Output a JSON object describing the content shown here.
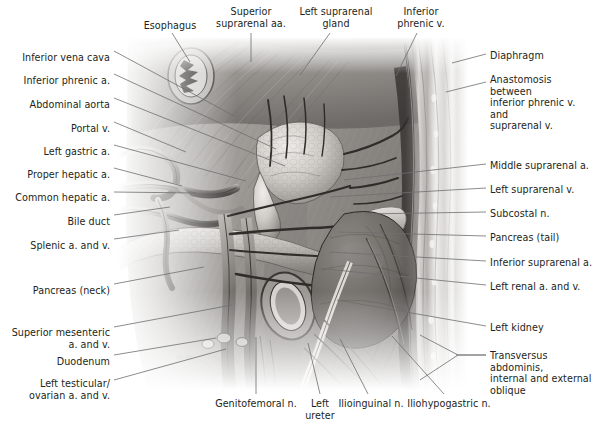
{
  "figure": {
    "type": "anatomical-illustration",
    "style": "grayscale halftone medical illustration",
    "artist_signature": "W.W.",
    "colors": {
      "background": "#ffffff",
      "leader_line": "#6e6e6e",
      "label_text": "#231f20",
      "plate_light": "#e9e7e4",
      "plate_mid": "#9a9692",
      "plate_dark": "#4a4744",
      "plate_darkest": "#262423"
    }
  },
  "labels": {
    "left": [
      {
        "id": "inferior-vena-cava",
        "text": "Inferior vena cava",
        "x": 110,
        "y": 52,
        "lead": [
          [
            114,
            51
          ],
          [
            236,
            117
          ]
        ]
      },
      {
        "id": "inferior-phrenic-a",
        "text": "Inferior phrenic a.",
        "x": 110,
        "y": 75,
        "lead": [
          [
            114,
            74
          ],
          [
            276,
            149
          ]
        ]
      },
      {
        "id": "abdominal-aorta",
        "text": "Abdominal aorta",
        "x": 110,
        "y": 99,
        "lead": [
          [
            114,
            98
          ],
          [
            285,
            166
          ]
        ]
      },
      {
        "id": "portal-v",
        "text": "Portal v.",
        "x": 110,
        "y": 123,
        "lead": [
          [
            114,
            122
          ],
          [
            186,
            152
          ]
        ]
      },
      {
        "id": "left-gastric-a",
        "text": "Left gastric a.",
        "x": 110,
        "y": 146,
        "lead": [
          [
            114,
            145
          ],
          [
            246,
            181
          ]
        ]
      },
      {
        "id": "proper-hepatic-a",
        "text": "Proper hepatic a.",
        "x": 110,
        "y": 169,
        "lead": [
          [
            114,
            168
          ],
          [
            182,
            186
          ]
        ]
      },
      {
        "id": "common-hepatic-a",
        "text": "Common hepatic a.",
        "x": 110,
        "y": 192,
        "lead": [
          [
            114,
            192
          ],
          [
            196,
            193
          ]
        ]
      },
      {
        "id": "bile-duct",
        "text": "Bile duct",
        "x": 110,
        "y": 216,
        "lead": [
          [
            114,
            215
          ],
          [
            170,
            207
          ]
        ]
      },
      {
        "id": "splenic-a-and-v",
        "text": "Splenic a. and v.",
        "x": 110,
        "y": 240,
        "lead": [
          [
            114,
            239
          ],
          [
            179,
            230
          ]
        ]
      },
      {
        "id": "pancreas-neck",
        "text": "Pancreas (neck)",
        "x": 110,
        "y": 285,
        "lead": [
          [
            114,
            284
          ],
          [
            204,
            267
          ]
        ]
      },
      {
        "id": "superior-mesenteric",
        "text": "Superior mesenteric\na. and v.",
        "x": 110,
        "y": 327,
        "lead": [
          [
            114,
            327
          ],
          [
            232,
            305
          ]
        ]
      },
      {
        "id": "duodenum",
        "text": "Duodenum",
        "x": 110,
        "y": 356,
        "lead": [
          [
            114,
            355
          ],
          [
            216,
            338
          ]
        ]
      },
      {
        "id": "left-testicular-ovarian",
        "text": "Left testicular/\novarian a. and v.",
        "x": 110,
        "y": 378,
        "lead": [
          [
            114,
            380
          ],
          [
            226,
            349
          ]
        ]
      }
    ],
    "right": [
      {
        "id": "diaphragm",
        "text": "Diaphragm",
        "x": 490,
        "y": 50,
        "lead": [
          [
            486,
            54
          ],
          [
            452,
            63
          ]
        ]
      },
      {
        "id": "anastomosis",
        "text": "Anastomosis between\ninferior phrenic v. and\nsuprarenal v.",
        "x": 490,
        "y": 74,
        "lead": [
          [
            486,
            82
          ],
          [
            446,
            92
          ]
        ]
      },
      {
        "id": "middle-suprarenal-a",
        "text": "Middle suprarenal a.",
        "x": 490,
        "y": 160,
        "lead": [
          [
            486,
            164
          ],
          [
            344,
            180
          ]
        ]
      },
      {
        "id": "left-suprarenal-v",
        "text": "Left suprarenal v.",
        "x": 490,
        "y": 184,
        "lead": [
          [
            486,
            188
          ],
          [
            330,
            197
          ]
        ]
      },
      {
        "id": "subcostal-n",
        "text": "Subcostal n.",
        "x": 490,
        "y": 208,
        "lead": [
          [
            486,
            212
          ],
          [
            364,
            214
          ]
        ]
      },
      {
        "id": "pancreas-tail",
        "text": "Pancreas (tail)",
        "x": 490,
        "y": 232,
        "lead": [
          [
            486,
            236
          ],
          [
            338,
            232
          ]
        ]
      },
      {
        "id": "inferior-suprarenal-a",
        "text": "Inferior suprarenal a.",
        "x": 490,
        "y": 257,
        "lead": [
          [
            486,
            261
          ],
          [
            330,
            252
          ]
        ]
      },
      {
        "id": "left-renal-a-and-v",
        "text": "Left renal a. and v.",
        "x": 490,
        "y": 281,
        "lead": [
          [
            486,
            285
          ],
          [
            316,
            268
          ]
        ]
      },
      {
        "id": "left-kidney",
        "text": "Left kidney",
        "x": 490,
        "y": 322,
        "lead": [
          [
            486,
            326
          ],
          [
            337,
            300
          ]
        ]
      },
      {
        "id": "transversus",
        "text": "Transversus abdominis,\ninternal and external\noblique",
        "x": 490,
        "y": 350,
        "lead": [
          [
            486,
            355
          ],
          [
            456,
            355
          ]
        ]
      }
    ],
    "top": [
      {
        "id": "esophagus",
        "text": "Esophagus",
        "x": 170,
        "y": 20,
        "lead": [
          [
            172,
            33
          ],
          [
            190,
            62
          ]
        ]
      },
      {
        "id": "superior-suprarenal-aa",
        "text": "Superior\nsuprarenal aa.",
        "x": 251,
        "y": 6,
        "lead": [
          [
            251,
            33
          ],
          [
            251,
            62
          ]
        ]
      },
      {
        "id": "left-suprarenal-gland",
        "text": "Left suprarenal\ngland",
        "x": 336,
        "y": 6,
        "lead": [
          [
            330,
            33
          ],
          [
            300,
            75
          ]
        ]
      },
      {
        "id": "inferior-phrenic-v",
        "text": "Inferior\nphrenic v.",
        "x": 421,
        "y": 6,
        "lead": [
          [
            417,
            33
          ],
          [
            396,
            76
          ]
        ]
      }
    ],
    "bottom": [
      {
        "id": "genitofemoral-n",
        "text": "Genitofemoral n.",
        "x": 256,
        "y": 398,
        "lead": [
          [
            256,
            394
          ],
          [
            256,
            337
          ]
        ]
      },
      {
        "id": "left-ureter",
        "text": "Left\nureter",
        "x": 320,
        "y": 398,
        "lead": [
          [
            320,
            394
          ],
          [
            308,
            343
          ]
        ]
      },
      {
        "id": "ilioinguinal-n",
        "text": "Ilioinguinal n.",
        "x": 371,
        "y": 398,
        "lead": [
          [
            368,
            394
          ],
          [
            340,
            339
          ]
        ]
      },
      {
        "id": "iliohypogastric-n",
        "text": "Iliohypogastric n.",
        "x": 449,
        "y": 398,
        "lead": [
          [
            444,
            394
          ],
          [
            392,
            336
          ]
        ]
      }
    ]
  },
  "bracket": {
    "id": "transversus-bracket",
    "points": "420,380 458,355 420,335",
    "tail": [
      [
        458,
        355
      ],
      [
        486,
        355
      ]
    ]
  }
}
